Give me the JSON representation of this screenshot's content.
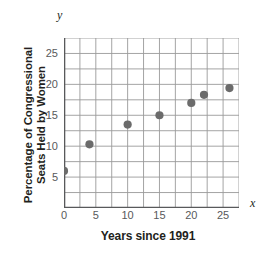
{
  "chart_data": {
    "type": "scatter",
    "title": "",
    "xlabel": "Years since 1991",
    "ylabel_lines": [
      "Percentage of Congressional",
      "Seats Held by Women"
    ],
    "ylabel": "Percentage of Congressional Seats Held by Women",
    "x_axis_letter": "x",
    "y_axis_letter": "y",
    "xlim": [
      0,
      27.5
    ],
    "ylim": [
      0,
      27.5
    ],
    "xticks": [
      0,
      5,
      10,
      15,
      20,
      25
    ],
    "yticks": [
      5,
      10,
      15,
      20,
      25
    ],
    "xtick_labels": [
      "0",
      "5",
      "10",
      "15",
      "20",
      "25"
    ],
    "ytick_labels": [
      "5",
      "10",
      "15",
      "20",
      "25"
    ],
    "grid": true,
    "grid_step_x": 2.5,
    "grid_step_y": 2.5,
    "legend": false,
    "marker_color": "#6b6b6b",
    "grid_color": "#9a9a9a",
    "axis_color": "#58595b",
    "points": [
      {
        "x": 0,
        "y": 6.0
      },
      {
        "x": 4,
        "y": 10.3
      },
      {
        "x": 10,
        "y": 13.5
      },
      {
        "x": 15,
        "y": 15.0
      },
      {
        "x": 20,
        "y": 17.0
      },
      {
        "x": 22,
        "y": 18.3
      },
      {
        "x": 26,
        "y": 19.4
      }
    ]
  }
}
